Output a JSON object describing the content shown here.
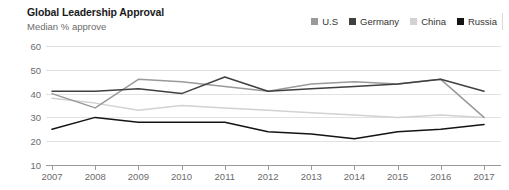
{
  "header": {
    "title": "Global Leadership Approval",
    "subtitle": "Median % approve"
  },
  "legend": {
    "position": "top-right",
    "items": [
      {
        "label": "U.S",
        "color": "#9a9a9a",
        "swatch": "square-swatch"
      },
      {
        "label": "Germany",
        "color": "#404040",
        "swatch": "square-swatch"
      },
      {
        "label": "China",
        "color": "#d2d2d2",
        "swatch": "square-swatch"
      },
      {
        "label": "Russia",
        "color": "#141414",
        "swatch": "square-swatch"
      }
    ]
  },
  "chart_data": {
    "type": "line",
    "title": "Global Leadership Approval",
    "subtitle": "Median % approve",
    "xlabel": "",
    "ylabel": "",
    "categories": [
      "2007",
      "2008",
      "2009",
      "2010",
      "2011",
      "2012",
      "2013",
      "2014",
      "2015",
      "2016",
      "2017"
    ],
    "x": [
      2007,
      2008,
      2009,
      2010,
      2011,
      2012,
      2013,
      2014,
      2015,
      2016,
      2017
    ],
    "ylim": [
      10,
      60
    ],
    "yticks": [
      10,
      20,
      30,
      40,
      50,
      60
    ],
    "ytick_labels": [
      "10",
      "20",
      "30",
      "40",
      "50",
      "60"
    ],
    "xlim": [
      2007,
      2017
    ],
    "grid": true,
    "grid_axis": "y",
    "legend_position": "top-right",
    "series": [
      {
        "name": "U.S",
        "color": "#9a9a9a",
        "values": [
          40,
          34,
          46,
          45,
          43,
          41,
          44,
          45,
          44,
          46,
          30
        ]
      },
      {
        "name": "Germany",
        "color": "#404040",
        "values": [
          41,
          41,
          42,
          40,
          47,
          41,
          42,
          43,
          44,
          46,
          41
        ]
      },
      {
        "name": "China",
        "color": "#d2d2d2",
        "values": [
          38,
          36,
          33,
          35,
          34,
          33,
          32,
          31,
          30,
          31,
          30
        ]
      },
      {
        "name": "Russia",
        "color": "#141414",
        "values": [
          25,
          30,
          28,
          28,
          28,
          24,
          23,
          21,
          24,
          25,
          27
        ]
      }
    ]
  }
}
